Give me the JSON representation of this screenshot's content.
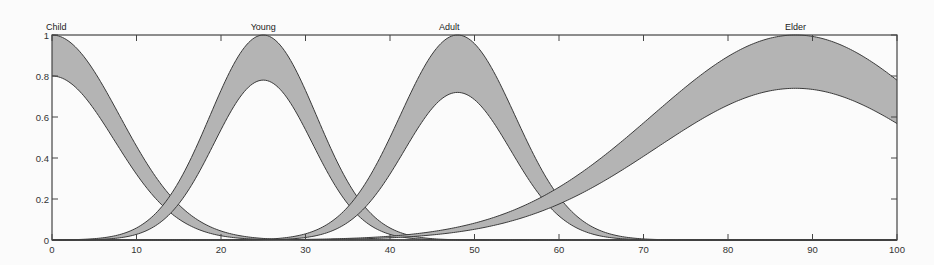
{
  "chart_data": {
    "type": "area",
    "title": "",
    "xlabel": "",
    "ylabel": "",
    "xlim": [
      0,
      100
    ],
    "ylim": [
      0,
      1
    ],
    "grid": false,
    "x_ticks": [
      0,
      10,
      20,
      30,
      40,
      50,
      60,
      70,
      80,
      90,
      100
    ],
    "y_ticks": [
      0,
      0.2,
      0.4,
      0.6,
      0.8,
      1
    ],
    "y_tick_labels": [
      "0",
      "0.2",
      "0.4",
      "0.6",
      "0.8",
      "1"
    ],
    "series": [
      {
        "name": "Child",
        "label_x": 0,
        "center": 0,
        "upper_height": 1.0,
        "lower_height": 0.8,
        "upper_sigma": 8.0,
        "lower_sigma": 7.4
      },
      {
        "name": "Young",
        "label_x": 25,
        "center": 25,
        "upper_height": 1.0,
        "lower_height": 0.78,
        "upper_sigma": 6.3,
        "lower_sigma": 5.8
      },
      {
        "name": "Adult",
        "label_x": 47,
        "center": 48,
        "upper_height": 1.0,
        "lower_height": 0.72,
        "upper_sigma": 6.8,
        "lower_sigma": 6.3
      },
      {
        "name": "Elder",
        "label_x": 88,
        "center": 88,
        "upper_height": 1.0,
        "lower_height": 0.74,
        "upper_sigma": 17.0,
        "lower_sigma": 16.5
      }
    ],
    "fill_color": "#b4b4b4",
    "line_color": "#3a3a3a"
  }
}
